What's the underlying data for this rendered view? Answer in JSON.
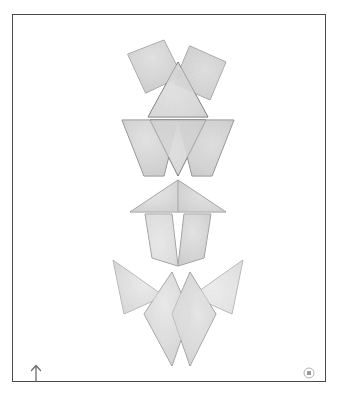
{
  "artwork": {
    "title": "Stacked Geometric Totem",
    "background_color": "#ffffff",
    "frame": {
      "border_color": "#4a4a4a",
      "border_width": 1.4,
      "x": 12,
      "y": 14,
      "width": 314,
      "height": 368
    },
    "palette": {
      "shape_fill_light": "#e8e8e8",
      "shape_fill_mid": "#d2d2d2",
      "shape_fill_dark": "#c2c2c2",
      "shape_fill_pale": "#f0f0f0",
      "outline_color": "#6b6b6b",
      "outline_soft": "#9a9a9a"
    },
    "shapes": [
      {
        "id": "top-left-tilted-square",
        "name": "tilted-square-left",
        "group": "row-1-upper",
        "fill": "#d2d2d2",
        "points": "116,40 152,26 170,62 134,79",
        "outline": "#9a9a9a",
        "rounded": true
      },
      {
        "id": "top-right-tilted-square",
        "name": "tilted-square-right",
        "group": "row-1-upper",
        "fill": "#d0d0d0",
        "points": "178,32 214,48 198,86 162,70",
        "outline": "#9a9a9a",
        "rounded": true
      },
      {
        "id": "top-center-up-triangle",
        "name": "upward-triangle-center",
        "group": "row-1-upper",
        "fill": "#cfcfcf",
        "points": "166,48 196,103 136,103",
        "outline": "#5e5e5e"
      },
      {
        "id": "mid-left-trapezoid",
        "name": "trapezoid-left",
        "group": "row-2-trapezoid",
        "fill": "#d4d4d4",
        "points": "110,106 166,106 152,162 132,162",
        "outline": "#7a7a7a"
      },
      {
        "id": "mid-right-trapezoid",
        "name": "trapezoid-right",
        "group": "row-2-trapezoid",
        "fill": "#d0d0d0",
        "points": "166,106 222,106 200,162 180,162",
        "outline": "#7a7a7a"
      },
      {
        "id": "mid-center-down-triangle",
        "name": "downward-triangle-center",
        "group": "row-2-trapezoid",
        "fill": "#c9c9c9",
        "points": "138,106 194,106 166,162",
        "outline": "#5e5e5e"
      },
      {
        "id": "wide-arrow-left-half",
        "name": "wide-shallow-triangle-left",
        "group": "row-3-arrow",
        "fill": "#e0e0e0",
        "points": "166,166 166,198 118,198",
        "outline": "#8c8c8c"
      },
      {
        "id": "wide-arrow-right-half",
        "name": "wide-shallow-triangle-right",
        "group": "row-3-arrow",
        "fill": "#dcdcdc",
        "points": "166,166 214,198 166,198",
        "outline": "#8c8c8c"
      },
      {
        "id": "chevron-left-panel",
        "name": "chevron-panel-left",
        "group": "row-4-chevron",
        "fill": "#dedede",
        "points": "133,200 160,200 166,252 140,244",
        "outline": "#8c8c8c"
      },
      {
        "id": "chevron-right-panel",
        "name": "chevron-panel-right",
        "group": "row-4-chevron",
        "fill": "#d8d8d8",
        "points": "172,200 199,200 192,244 166,252",
        "outline": "#8c8c8c"
      },
      {
        "id": "wing-left-outer",
        "name": "dart-wing-left-outer",
        "group": "row-5-wings",
        "fill": "#eaeaea",
        "points": "101,246 152,282 112,300",
        "outline": "#a8a8a8"
      },
      {
        "id": "wing-right-outer",
        "name": "dart-wing-right-outer",
        "group": "row-5-wings",
        "fill": "#e6e6e6",
        "points": "231,246 220,300 180,282",
        "outline": "#a8a8a8"
      },
      {
        "id": "pendant-left",
        "name": "elongated-kite-left",
        "group": "row-6-pendants",
        "fill": "#e4e4e4",
        "points": "160,258 178,300 160,352 132,300",
        "outline": "#8e8e8e"
      },
      {
        "id": "pendant-right",
        "name": "elongated-kite-right",
        "group": "row-6-pendants",
        "fill": "#e0e0e0",
        "points": "178,258 204,300 178,352 160,300",
        "outline": "#8e8e8e"
      }
    ]
  },
  "corner_marks": {
    "arrow": {
      "icon": "up-arrow-icon",
      "color": "#6b6b6b",
      "position": "bottom-left"
    },
    "badge": {
      "icon": "circular-logo-mark-icon",
      "color": "#9a9a9a",
      "position": "bottom-right"
    }
  }
}
